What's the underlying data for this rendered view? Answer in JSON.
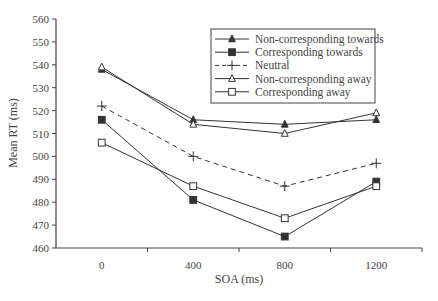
{
  "chart_data": {
    "type": "line",
    "title": "",
    "xlabel": "SOA (ms)",
    "ylabel": "Mean RT (ms)",
    "categories": [
      "0",
      "400",
      "800",
      "1200"
    ],
    "ylim": [
      460,
      560
    ],
    "yticks": [
      460,
      470,
      480,
      490,
      500,
      510,
      520,
      530,
      540,
      550,
      560
    ],
    "grid": false,
    "legend_position": "upper right (inside)",
    "series": [
      {
        "name": "Non-corresponding towards",
        "marker": "filled-triangle",
        "line": "solid",
        "values": [
          538,
          516,
          514,
          516
        ]
      },
      {
        "name": "Corresponding towards",
        "marker": "filled-square",
        "line": "solid",
        "values": [
          516,
          481,
          465,
          489
        ]
      },
      {
        "name": "Neutral",
        "marker": "plus",
        "line": "dashed",
        "values": [
          522,
          500,
          487,
          497
        ]
      },
      {
        "name": "Non-corresponding away",
        "marker": "open-triangle",
        "line": "solid",
        "values": [
          539,
          514,
          510,
          519
        ]
      },
      {
        "name": "Corresponding away",
        "marker": "open-square",
        "line": "solid",
        "values": [
          506,
          487,
          473,
          487
        ]
      }
    ]
  },
  "colors": {
    "line": "#333333",
    "axis": "#444444",
    "background": "#ffffff"
  }
}
